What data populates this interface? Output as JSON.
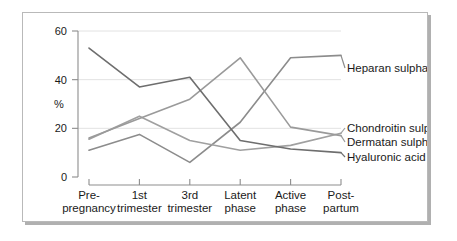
{
  "chart_data": {
    "type": "line",
    "title": "",
    "xlabel": "",
    "ylabel": "%",
    "ylim": [
      0,
      60
    ],
    "yticks": [
      0,
      20,
      40,
      60
    ],
    "grid": true,
    "legend_position": "right-inline",
    "categories": [
      "Pre-\npregnancy",
      "1st\ntrimester",
      "3rd\ntrimester",
      "Latent\nphase",
      "Active\nphase",
      "Post-\npartum"
    ],
    "series": [
      {
        "name": "Heparan sulphate",
        "color": "#8c8c8c",
        "values": [
          11,
          17.5,
          6,
          22.5,
          49,
          50
        ]
      },
      {
        "name": "Chondroitin sulphates",
        "color": "#a0a0a0",
        "values": [
          15.5,
          25,
          15,
          11,
          13,
          18
        ]
      },
      {
        "name": "Dermatan sulphate",
        "color": "#9a9a9a",
        "values": [
          16,
          24,
          32,
          49,
          20.5,
          17
        ]
      },
      {
        "name": "Hyaluronic acid",
        "color": "#6e6e6e",
        "values": [
          53,
          37,
          41,
          15,
          11.5,
          10
        ]
      }
    ]
  },
  "axis": {
    "y_title": "%",
    "y_tick_labels": [
      "0",
      "20",
      "40",
      "60"
    ]
  },
  "categories_lines": [
    [
      "Pre-",
      "pregnancy"
    ],
    [
      "1st",
      "trimester"
    ],
    [
      "3rd",
      "trimester"
    ],
    [
      "Latent",
      "phase"
    ],
    [
      "Active",
      "phase"
    ],
    [
      "Post-",
      "partum"
    ]
  ],
  "series_labels": [
    "Heparan sulphate",
    "Chondroitin sulphates",
    "Dermatan sulphate",
    "Hyaluronic acid"
  ]
}
